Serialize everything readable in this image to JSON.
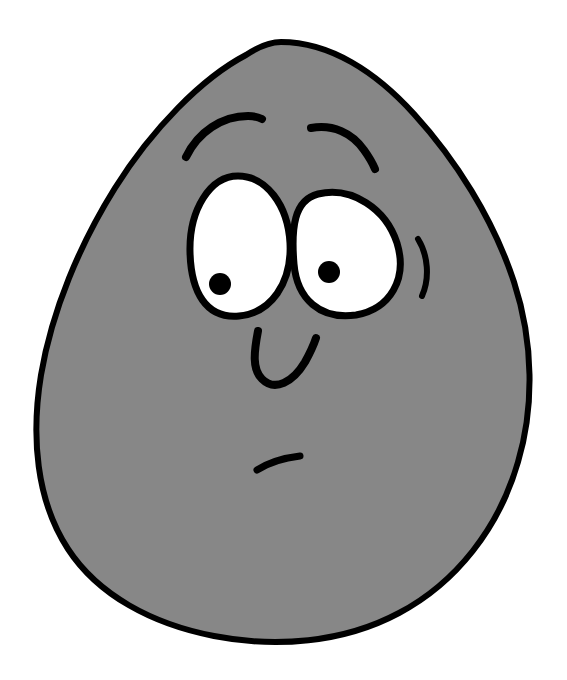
{
  "canvas": {
    "width": 567,
    "height": 680,
    "background_color": "#ffffff",
    "title": "Cartoon gray blob character with a puzzled expression"
  },
  "palette": {
    "background": "#ffffff",
    "body_fill": "#878787",
    "outline": "#000000",
    "eye_white": "#ffffff",
    "pupil": "#000000"
  },
  "character": {
    "name": "gray-egg-blob",
    "expression_label": "puzzled",
    "body": {
      "shape_label": "egg-blob-body",
      "fill": "#878787",
      "stroke": "#000000",
      "stroke_width": 6,
      "path": "M 281 42 C 330 42 376 72 414 114 C 455 159 493 218 514 282 C 534 343 534 408 518 462 C 499 528 456 583 399 613 C 343 643 275 648 214 636 C 152 624 98 595 68 549 C 36 500 31 436 41 375 C 52 310 80 244 115 188 C 152 129 202 78 246 55 C 258 47 270 42 281 42 Z"
    },
    "eyebrow_left": {
      "shape_label": "left-eyebrow",
      "stroke": "#000000",
      "stroke_width": 8,
      "path": "M 186 157 C 198 132 222 116 248 116 C 253 116 258 117 262 119"
    },
    "eyebrow_right": {
      "shape_label": "right-eyebrow",
      "stroke": "#000000",
      "stroke_width": 8,
      "path": "M 311 128 C 333 124 352 133 364 150 C 369 157 373 164 375 169"
    },
    "eye_left": {
      "shape_label": "left-eye",
      "fill": "#ffffff",
      "stroke": "#000000",
      "stroke_width": 7,
      "path": "M 238 176 C 266 176 288 205 290 243 C 292 283 271 313 239 316 C 206 319 191 292 190 252 C 189 210 210 176 238 176 Z",
      "pupil": {
        "cx": 220,
        "cy": 284,
        "r": 11,
        "fill": "#000000"
      }
    },
    "eye_right": {
      "shape_label": "right-eye",
      "fill": "#ffffff",
      "stroke": "#000000",
      "stroke_width": 7,
      "path": "M 318 194 C 352 186 386 209 397 243 C 408 279 390 309 356 315 C 320 320 297 299 294 264 C 291 228 294 200 318 194 Z",
      "pupil": {
        "cx": 329,
        "cy": 272,
        "r": 11,
        "fill": "#000000"
      }
    },
    "cheek_mark": {
      "shape_label": "cheek-swish",
      "stroke": "#000000",
      "stroke_width": 6,
      "path": "M 418 239 C 428 255 430 278 422 296"
    },
    "nose": {
      "shape_label": "nose-hook",
      "stroke": "#000000",
      "stroke_width": 8,
      "path": "M 258 331 C 254 352 252 369 262 379 C 275 392 293 382 305 362 C 310 353 314 344 316 338"
    },
    "mouth": {
      "shape_label": "mouth-dash",
      "stroke": "#000000",
      "stroke_width": 7,
      "path": "M 257 470 C 268 463 283 458 300 456"
    }
  }
}
